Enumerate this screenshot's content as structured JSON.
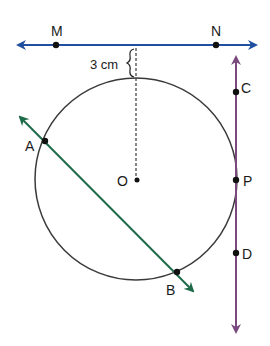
{
  "diagram": {
    "colors": {
      "line_mn": "#1f4fa0",
      "line_ab": "#1e6b4a",
      "line_cd": "#7a4a7e",
      "circle": "#3a3a3a",
      "point": "#111111"
    },
    "points": {
      "M": "M",
      "N": "N",
      "C": "C",
      "P": "P",
      "D": "D",
      "A": "A",
      "B": "B",
      "O": "O"
    },
    "distance_label": "3 cm"
  }
}
